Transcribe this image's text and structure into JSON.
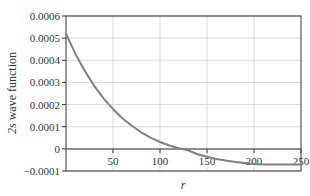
{
  "chart_data": {
    "type": "line",
    "title": "",
    "xlabel": "r",
    "ylabel": "2s wave function",
    "xlim": [
      0,
      250
    ],
    "ylim": [
      -0.0001,
      0.0006
    ],
    "x_ticks": [
      "50",
      "100",
      "150",
      "200",
      "250"
    ],
    "y_ticks": [
      "0.0006",
      "0.0005",
      "0.0004",
      "0.0003",
      "0.0002",
      "0.0001",
      "0",
      "−0.0001"
    ],
    "grid": true,
    "legend": null,
    "series": [
      {
        "name": "2s wave function",
        "color": "#808080",
        "x": [
          0,
          10,
          20,
          30,
          40,
          50,
          60,
          70,
          80,
          90,
          100,
          110,
          120,
          130,
          140,
          150,
          160,
          170,
          180,
          190,
          200,
          210,
          220,
          230,
          240,
          250
        ],
        "values": [
          0.00052,
          0.000429,
          0.000352,
          0.000285,
          0.000228,
          0.000179,
          0.000138,
          0.000104,
          7.5e-05,
          5.1e-05,
          3.1e-05,
          1.5e-05,
          3e-06,
          -7e-06,
          -2.4e-05,
          -3.6e-05,
          -4.6e-05,
          -5.3e-05,
          -5.9e-05,
          -6.4e-05,
          -6.8e-05,
          -7e-05,
          -7.1e-05,
          -7.1e-05,
          -7.1e-05,
          -7e-05
        ]
      }
    ]
  }
}
